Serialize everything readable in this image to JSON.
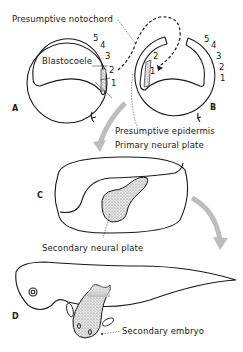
{
  "labels": {
    "presumptive_notochord": "Presumptive notochord",
    "blastocoele": "Blastocoele",
    "presumptive_epidermis": "Presumptive epidermis",
    "primary_neural_plate": "Primary neural plate",
    "secondary_neural_plate": "Secondary neural plate",
    "secondary_embryo": "Secondary embryo"
  },
  "panels": {
    "a": "A",
    "b": "B",
    "c": "C",
    "d": "D"
  },
  "numbers_a": [
    "5",
    "4",
    "3",
    "2",
    "1"
  ],
  "numbers_b_outer": [
    "5",
    "4",
    "3",
    "2",
    "1"
  ],
  "numbers_b_inner": [
    "2",
    "1"
  ],
  "colors": {
    "line": "#1a1a1a",
    "arrow_gray": "#bdbdbd",
    "stipple": "#a8a8a8"
  }
}
